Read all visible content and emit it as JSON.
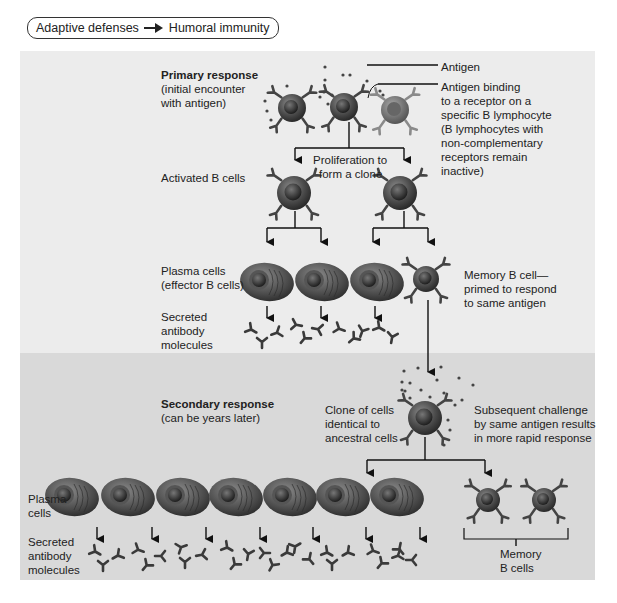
{
  "breadcrumb": {
    "parent": "Adaptive defenses",
    "separator_icon": "right-arrow-icon",
    "current": "Humoral immunity"
  },
  "primary": {
    "title": "Primary response",
    "subtitle_line1": "(initial encounter",
    "subtitle_line2": "with antigen)",
    "antigen_label": "Antigen",
    "binding_label": [
      "Antigen binding",
      "to a receptor on a",
      "specific B lymphocyte",
      "(B lymphocytes with",
      "non-complementary",
      "receptors remain",
      "inactive)"
    ],
    "proliferation_label": [
      "Proliferation to",
      "form a clone"
    ],
    "activated_label": "Activated B cells",
    "plasma_label": [
      "Plasma cells",
      "(effector B cells)"
    ],
    "antibody_label": [
      "Secreted",
      "antibody",
      "molecules"
    ],
    "memory_label": [
      "Memory B cell—",
      "primed to respond",
      "to same antigen"
    ]
  },
  "secondary": {
    "title": "Secondary response",
    "subtitle": "(can be years later)",
    "clone_label": [
      "Clone of cells",
      "identical to",
      "ancestral cells"
    ],
    "challenge_label": [
      "Subsequent challenge",
      "by same antigen results",
      "in more rapid response"
    ],
    "plasma_label": [
      "Plasma",
      "cells"
    ],
    "antibody_label": [
      "Secreted",
      "antibody",
      "molecules"
    ],
    "memory_label": [
      "Memory",
      "B cells"
    ]
  },
  "colors": {
    "primary_bg": "#ececec",
    "secondary_bg": "#d9d9d9",
    "cell_dark": "#3a3a3a",
    "cell_mid": "#6b6b6b",
    "inactive_cell": "#8a8a8a"
  }
}
